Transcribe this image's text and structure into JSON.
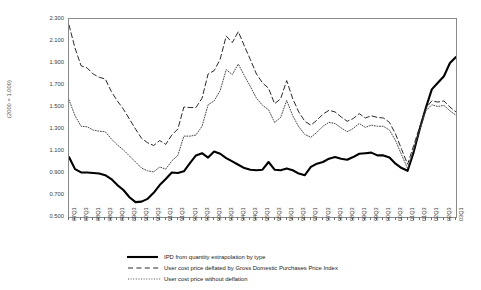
{
  "chart_data": {
    "type": "line",
    "title": "",
    "subtitle": "",
    "xlabel": "",
    "ylabel": "(2000 = 1.000)",
    "ylim": [
      0.5,
      2.3
    ],
    "ytick_step": 0.2,
    "ytick_labels": [
      "2.300",
      "2.100",
      "1.900",
      "1.700",
      "1.500",
      "1.300",
      "1.100",
      "0.900",
      "0.700",
      "0.500"
    ],
    "ytick_values": [
      2.3,
      2.1,
      1.9,
      1.7,
      1.5,
      1.3,
      1.1,
      0.9,
      0.7,
      0.5
    ],
    "grid": false,
    "legend_position": "bottom",
    "x_labeled_every": 2,
    "x": [
      "87Q1",
      "87Q2",
      "87Q3",
      "87Q4",
      "88Q1",
      "88Q2",
      "88Q3",
      "88Q4",
      "89Q1",
      "89Q2",
      "89Q3",
      "89Q4",
      "90Q1",
      "90Q2",
      "90Q3",
      "90Q4",
      "91Q1",
      "91Q2",
      "91Q3",
      "91Q4",
      "92Q1",
      "92Q2",
      "92Q3",
      "92Q4",
      "93Q1",
      "93Q2",
      "93Q3",
      "93Q4",
      "94Q1",
      "94Q2",
      "94Q3",
      "94Q4",
      "95Q1",
      "95Q2",
      "95Q3",
      "95Q4",
      "96Q1",
      "96Q2",
      "96Q3",
      "96Q4",
      "97Q1",
      "97Q2",
      "97Q3",
      "97Q4",
      "98Q1",
      "98Q2",
      "98Q3",
      "98Q4",
      "99Q1",
      "99Q2",
      "99Q3",
      "99Q4",
      "00Q1",
      "00Q2",
      "00Q3",
      "00Q4",
      "01Q1",
      "01Q2",
      "01Q3",
      "01Q4",
      "02Q1",
      "02Q2",
      "02Q3",
      "02Q4",
      "03Q1"
    ],
    "xtick_labels": [
      "87Q1",
      "87Q3",
      "88Q1",
      "88Q3",
      "89Q1",
      "89Q3",
      "90Q1",
      "90Q3",
      "91Q1",
      "91Q3",
      "92Q1",
      "92Q3",
      "93Q1",
      "93Q3",
      "94Q1",
      "94Q3",
      "95Q1",
      "95Q3",
      "96Q1",
      "96Q3",
      "97Q1",
      "97Q3",
      "98Q1",
      "98Q3",
      "99Q1",
      "99Q3",
      "00Q1",
      "00Q3",
      "01Q1",
      "01Q3",
      "02Q1",
      "02Q3",
      "03Q1"
    ],
    "series": [
      {
        "name": "IPD from quantity extrapolation by type",
        "style": "solid",
        "color": "#000000",
        "width": 2.1,
        "values": [
          1.045,
          0.935,
          0.905,
          0.905,
          0.9,
          0.895,
          0.88,
          0.845,
          0.79,
          0.745,
          0.68,
          0.635,
          0.64,
          0.665,
          0.72,
          0.79,
          0.845,
          0.905,
          0.9,
          0.915,
          0.99,
          1.06,
          1.08,
          1.04,
          1.095,
          1.075,
          1.035,
          1.005,
          0.975,
          0.945,
          0.93,
          0.925,
          0.93,
          1.0,
          0.93,
          0.925,
          0.94,
          0.925,
          0.895,
          0.88,
          0.955,
          0.985,
          1.0,
          1.03,
          1.045,
          1.03,
          1.02,
          1.045,
          1.075,
          1.08,
          1.085,
          1.06,
          1.06,
          1.04,
          0.985,
          0.945,
          0.92,
          1.09,
          1.3,
          1.49,
          1.66,
          1.72,
          1.78,
          1.9,
          1.955
        ]
      },
      {
        "name": "User cost price deflated by Gross Domestic Purchases Price Index",
        "style": "dashed",
        "color": "#2a2a2a",
        "width": 1.0,
        "values": [
          2.245,
          2.035,
          1.875,
          1.855,
          1.8,
          1.77,
          1.755,
          1.64,
          1.555,
          1.48,
          1.39,
          1.3,
          1.215,
          1.175,
          1.15,
          1.195,
          1.16,
          1.245,
          1.3,
          1.5,
          1.495,
          1.495,
          1.58,
          1.8,
          1.83,
          1.935,
          2.145,
          2.085,
          2.185,
          2.055,
          1.93,
          1.8,
          1.72,
          1.67,
          1.53,
          1.575,
          1.74,
          1.575,
          1.455,
          1.37,
          1.335,
          1.38,
          1.435,
          1.47,
          1.455,
          1.41,
          1.37,
          1.395,
          1.44,
          1.4,
          1.42,
          1.405,
          1.4,
          1.36,
          1.255,
          1.115,
          0.98,
          1.15,
          1.32,
          1.49,
          1.555,
          1.545,
          1.555,
          1.5,
          1.455
        ]
      },
      {
        "name": "User cost price without deflation",
        "style": "dotted",
        "color": "#4d4d4d",
        "width": 1.0,
        "values": [
          1.565,
          1.42,
          1.325,
          1.32,
          1.29,
          1.28,
          1.275,
          1.21,
          1.155,
          1.11,
          1.055,
          1.0,
          0.945,
          0.92,
          0.91,
          0.955,
          0.935,
          1.01,
          1.06,
          1.235,
          1.235,
          1.245,
          1.325,
          1.52,
          1.555,
          1.65,
          1.84,
          1.795,
          1.89,
          1.785,
          1.685,
          1.58,
          1.515,
          1.475,
          1.36,
          1.405,
          1.56,
          1.42,
          1.32,
          1.25,
          1.225,
          1.27,
          1.325,
          1.36,
          1.35,
          1.31,
          1.275,
          1.305,
          1.35,
          1.315,
          1.335,
          1.325,
          1.325,
          1.29,
          1.195,
          1.065,
          0.94,
          1.115,
          1.29,
          1.465,
          1.52,
          1.505,
          1.515,
          1.465,
          1.425
        ]
      }
    ]
  },
  "legend": {
    "items": [
      {
        "label": "IPD from quantity extrapolation by type",
        "style": "solid"
      },
      {
        "label": "User cost price deflated by Gross Domestic Purchases Price Index",
        "style": "dashed"
      },
      {
        "label": "User cost price without deflation",
        "style": "dotted"
      }
    ]
  },
  "colors": {
    "background": "#ffffff",
    "frame": "#8a8a8a",
    "tick": "#6f6f6f",
    "text": "#3c3c3c",
    "solid_series": "#000000",
    "dashed_series": "#2a2a2a",
    "dotted_series": "#4d4d4d"
  }
}
